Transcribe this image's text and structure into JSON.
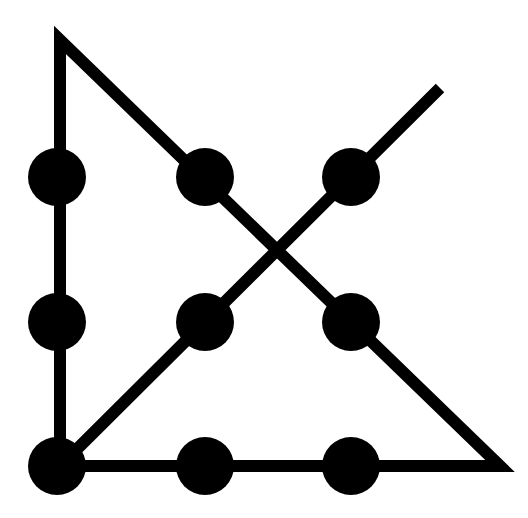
{
  "diagram": {
    "colors": {
      "background": "#ffffff",
      "ink": "#000000"
    },
    "line_width": 12,
    "dot_radius": 29,
    "dots": [
      {
        "x": 57,
        "y": 177
      },
      {
        "x": 205,
        "y": 177
      },
      {
        "x": 351,
        "y": 177
      },
      {
        "x": 57,
        "y": 322
      },
      {
        "x": 205,
        "y": 322
      },
      {
        "x": 351,
        "y": 322
      },
      {
        "x": 57,
        "y": 466
      },
      {
        "x": 205,
        "y": 466
      },
      {
        "x": 351,
        "y": 466
      }
    ],
    "path": [
      {
        "x": 440,
        "y": 88
      },
      {
        "x": 60,
        "y": 466
      },
      {
        "x": 500,
        "y": 466
      },
      {
        "x": 60,
        "y": 40
      },
      {
        "x": 60,
        "y": 466
      }
    ]
  }
}
